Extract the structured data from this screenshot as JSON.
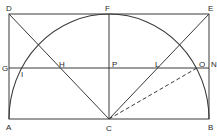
{
  "diagram": {
    "type": "geometric-construction",
    "stroke_color": "#3a3a3a",
    "points": {
      "A": {
        "label": "A",
        "x": 9,
        "y": 119
      },
      "B": {
        "label": "B",
        "x": 209,
        "y": 119
      },
      "C": {
        "label": "C",
        "x": 109,
        "y": 119
      },
      "D": {
        "label": "D",
        "x": 9,
        "y": 14
      },
      "E": {
        "label": "E",
        "x": 209,
        "y": 14
      },
      "F": {
        "label": "F",
        "x": 109,
        "y": 14
      },
      "G": {
        "label": "G",
        "x": 9,
        "y": 68
      },
      "N": {
        "label": "N",
        "x": 209,
        "y": 68
      },
      "P": {
        "label": "P",
        "x": 109,
        "y": 68
      },
      "H": {
        "label": "H",
        "x": 61,
        "y": 68
      },
      "L": {
        "label": "L",
        "x": 157,
        "y": 68
      },
      "I": {
        "label": "I",
        "x": 22,
        "y": 68
      },
      "O": {
        "label": "O",
        "x": 197,
        "y": 68
      }
    },
    "segments": [
      {
        "from": "A",
        "to": "B",
        "style": "solid"
      },
      {
        "from": "D",
        "to": "E",
        "style": "solid"
      },
      {
        "from": "A",
        "to": "D",
        "style": "solid"
      },
      {
        "from": "B",
        "to": "E",
        "style": "solid"
      },
      {
        "from": "G",
        "to": "N",
        "style": "solid"
      },
      {
        "from": "F",
        "to": "C",
        "style": "solid"
      },
      {
        "from": "D",
        "to": "C",
        "style": "solid"
      },
      {
        "from": "E",
        "to": "C",
        "style": "solid"
      },
      {
        "from": "C",
        "to": "O",
        "style": "dashed"
      }
    ],
    "arcs": [
      {
        "center": "C",
        "through": [
          "A",
          "F",
          "B"
        ],
        "radius": 100
      }
    ]
  }
}
